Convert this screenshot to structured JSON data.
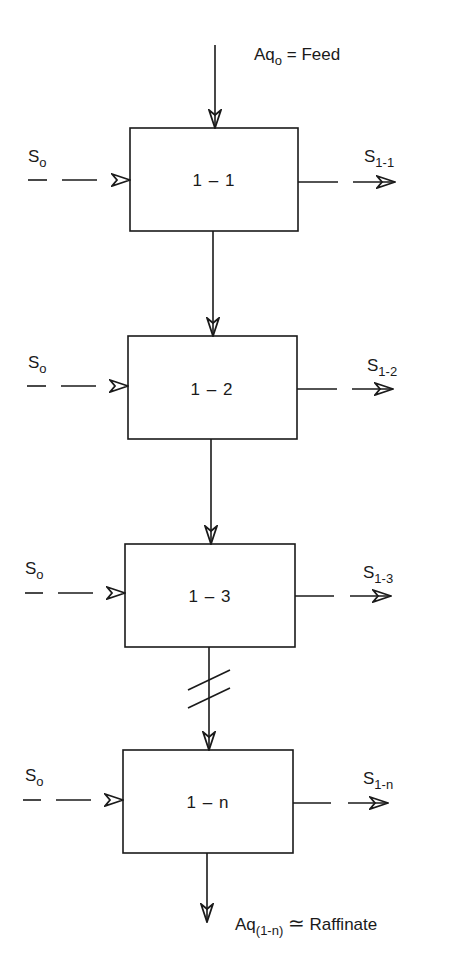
{
  "feed": {
    "label_main": "Aq",
    "label_sub": "o",
    "label_rest": " = Feed"
  },
  "stages": [
    {
      "name": "1 – 1",
      "solvent_in_main": "S",
      "solvent_in_sub": "o",
      "extract_out_main": "S",
      "extract_out_sub": "1-1"
    },
    {
      "name": "1 – 2",
      "solvent_in_main": "S",
      "solvent_in_sub": "o",
      "extract_out_main": "S",
      "extract_out_sub": "1-2"
    },
    {
      "name": "1 – 3",
      "solvent_in_main": "S",
      "solvent_in_sub": "o",
      "extract_out_main": "S",
      "extract_out_sub": "1-3"
    },
    {
      "name": "1 – n",
      "solvent_in_main": "S",
      "solvent_in_sub": "o",
      "extract_out_main": "S",
      "extract_out_sub": "1-n"
    }
  ],
  "raffinate": {
    "label_main": "Aq",
    "label_sub": "(1-n)",
    "approx_symbol": "≃",
    "label_rest": "Raffinate"
  },
  "break_marker": "//",
  "colors": {
    "line": "#1a1a1a",
    "background": "#ffffff"
  }
}
